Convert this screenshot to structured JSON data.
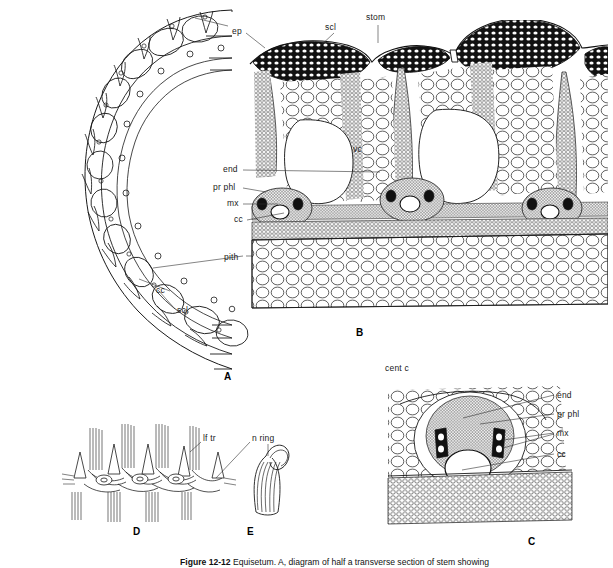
{
  "figure": {
    "caption_number": "Figure 12-12",
    "caption_text": "Equisetum. A, diagram of half a transverse section of stem showing",
    "panels": [
      {
        "id": "A",
        "letter": "A",
        "description": "transverse section of half stem, diagrammatic"
      },
      {
        "id": "B",
        "letter": "B",
        "description": "detail of stem cortex, vallecular canal and vascular bundles"
      },
      {
        "id": "C",
        "letter": "C",
        "description": "detail of single vascular bundle with carinal canal"
      },
      {
        "id": "D",
        "letter": "D",
        "description": "nodal region showing leaf traces"
      },
      {
        "id": "E",
        "letter": "E",
        "description": "detail of nodal ring"
      }
    ]
  },
  "labels": {
    "panel_a": [
      {
        "key": "pith",
        "text": "pith",
        "x": 224,
        "y": 258
      },
      {
        "key": "cc",
        "text": "cc",
        "x": 156,
        "y": 291
      },
      {
        "key": "scl",
        "text": "scl",
        "x": 177,
        "y": 311
      }
    ],
    "panel_b": [
      {
        "key": "ep",
        "text": "ep",
        "x": 232,
        "y": 32
      },
      {
        "key": "scl",
        "text": "scl",
        "x": 325,
        "y": 28
      },
      {
        "key": "stom",
        "text": "stom",
        "x": 367,
        "y": 17
      },
      {
        "key": "vc",
        "text": "vc",
        "x": 354,
        "y": 148
      },
      {
        "key": "end",
        "text": "end",
        "x": 224,
        "y": 169
      },
      {
        "key": "pr-phl",
        "text": "pr phl",
        "x": 215,
        "y": 186
      },
      {
        "key": "mx",
        "text": "mx",
        "x": 228,
        "y": 202
      },
      {
        "key": "cc",
        "text": "cc",
        "x": 234,
        "y": 218
      }
    ],
    "panel_c": [
      {
        "key": "cent-c",
        "text": "cent c",
        "x": 385,
        "y": 368
      },
      {
        "key": "end",
        "text": "end",
        "x": 557,
        "y": 396
      },
      {
        "key": "pr-phl",
        "text": "pr phl",
        "x": 557,
        "y": 415
      },
      {
        "key": "mx",
        "text": "mx",
        "x": 557,
        "y": 434
      },
      {
        "key": "cc",
        "text": "cc",
        "x": 557,
        "y": 455
      }
    ],
    "panel_d": [
      {
        "key": "lf-tr",
        "text": "lf tr",
        "x": 204,
        "y": 438
      }
    ],
    "panel_e": [
      {
        "key": "n-ring",
        "text": "n ring",
        "x": 253,
        "y": 438
      }
    ]
  },
  "panel_letters": [
    {
      "key": "A",
      "text": "A",
      "x": 224,
      "y": 372
    },
    {
      "key": "B",
      "text": "B",
      "x": 357,
      "y": 328
    },
    {
      "key": "C",
      "text": "C",
      "x": 529,
      "y": 537
    },
    {
      "key": "D",
      "text": "D",
      "x": 134,
      "y": 527
    },
    {
      "key": "E",
      "text": "E",
      "x": 248,
      "y": 527
    }
  ],
  "colors": {
    "ink": "#1a1a1a",
    "background": "#ffffff",
    "fill_dark": "#0c0c0c",
    "leader": "#333333"
  }
}
